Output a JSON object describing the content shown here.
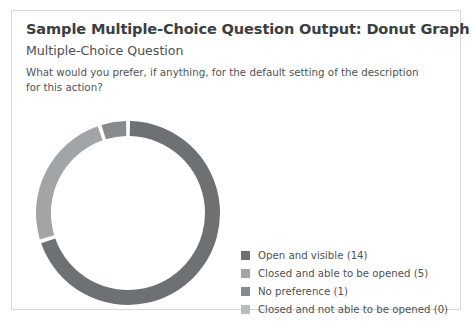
{
  "card": {
    "title": "Sample Multiple-Choice Question Output: Donut Graph",
    "subtitle": "Multiple-Choice Question",
    "question": "What would you prefer, if anything, for the default setting of the description for this action?"
  },
  "legend": {
    "items": [
      {
        "label": "Open and visible (14)",
        "color": "#6e7174"
      },
      {
        "label": "Closed and able to be opened (5)",
        "color": "#a2a5a7"
      },
      {
        "label": "No preference (1)",
        "color": "#888b8e"
      },
      {
        "label": "Closed and not able to be opened (0)",
        "color": "#b9bbbd"
      }
    ]
  },
  "chart_data": {
    "type": "pie",
    "title": "Sample Multiple-Choice Question Output: Donut Graph",
    "subtitle": "Multiple-Choice Question",
    "annotation": "What would you prefer, if anything, for the default setting of the description for this action?",
    "donut": true,
    "inner_radius_ratio": 0.84,
    "start_angle_deg": -90,
    "direction": "clockwise",
    "gap_deg": 2.5,
    "total": 20,
    "legend_position": "bottom-right",
    "grid": false,
    "categories": [
      "Open and visible",
      "Closed and able to be opened",
      "No preference",
      "Closed and not able to be opened"
    ],
    "values": [
      14,
      5,
      1,
      0
    ],
    "percentages": [
      70,
      25,
      5,
      0
    ],
    "colors": [
      "#6e7174",
      "#a2a5a7",
      "#888b8e",
      "#b9bbbd"
    ],
    "labels": [
      "Open and visible (14)",
      "Closed and able to be opened (5)",
      "No preference (1)",
      "Closed and not able to be opened (0)"
    ],
    "geometry": {
      "cx": 96,
      "cy": 100,
      "outer_radius": 92,
      "ring_thickness": 15
    }
  }
}
